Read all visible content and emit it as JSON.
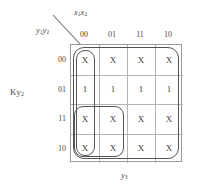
{
  "diagram": {
    "type": "karnaugh-map",
    "function_label": "Ky",
    "function_label_sub": "2",
    "column_variable": "x",
    "column_variable_sub": "1",
    "column_variable_2": "x",
    "column_variable_2_sub": "2",
    "row_variable": "y",
    "row_variable_sub": "1",
    "row_variable_2": "y",
    "row_variable_2_sub": "2",
    "bottom_axis": "y",
    "bottom_axis_sub": "3",
    "column_headers": [
      "00",
      "01",
      "11",
      "10"
    ],
    "row_headers": [
      "00",
      "01",
      "11",
      "10"
    ],
    "cells": [
      [
        "X",
        "X",
        "X",
        "X"
      ],
      [
        "1",
        "1",
        "1",
        "1"
      ],
      [
        "X",
        "X",
        "X",
        "X"
      ],
      [
        "X",
        "X",
        "X",
        "X"
      ]
    ],
    "groups": [
      {
        "name": "full-map-group",
        "rows": "00-10",
        "cols": "00-10"
      },
      {
        "name": "column-00-group",
        "rows": "00-10",
        "cols": "00"
      },
      {
        "name": "bottom-left-group",
        "rows": "11-10",
        "cols": "00-01"
      }
    ],
    "colors": {
      "grid_line": "#b4b4b4",
      "grid_border": "#9a9a9a",
      "loop_stroke": "#555555",
      "text": "#3c3c3c",
      "background": "#ffffff"
    }
  }
}
